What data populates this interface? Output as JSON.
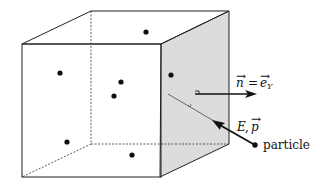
{
  "diagram": {
    "colors": {
      "stroke": "#222222",
      "shaded_face": "#dcdcdc",
      "dot": "#111111"
    },
    "labels": {
      "normal_vector": {
        "lhs": "n",
        "eq": "=",
        "rhs": "e",
        "subscript": "Y"
      },
      "energy_momentum": {
        "E": "E",
        "sep": ",",
        "p": "p"
      },
      "particle": "particle"
    },
    "particles_in_box": [
      {
        "x": 146,
        "y": 32
      },
      {
        "x": 60,
        "y": 73
      },
      {
        "x": 121,
        "y": 82
      },
      {
        "x": 114,
        "y": 96
      },
      {
        "x": 171,
        "y": 75
      },
      {
        "x": 67,
        "y": 142
      },
      {
        "x": 132,
        "y": 155
      }
    ]
  }
}
